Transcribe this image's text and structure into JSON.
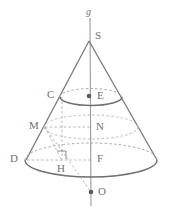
{
  "figure": {
    "stroke_color": "#7a7a7a",
    "dash_color": "#9a9a9a",
    "label_color": "#6f6f6f",
    "background": "#ffffff"
  },
  "labels": {
    "axis": "g",
    "apex": "S",
    "upper_left": "C",
    "upper_center": "E",
    "mid_left": "M",
    "mid_center": "N",
    "base_left": "D",
    "foot": "H",
    "base_center": "F",
    "below": "O"
  },
  "geometry": {
    "apex": [
      89,
      40
    ],
    "axis_top": [
      90,
      18
    ],
    "axis_bottom": [
      91,
      205
    ],
    "base_center": [
      91,
      160
    ],
    "base_rx": 66,
    "base_ry": 17,
    "upper_center": [
      91,
      96
    ],
    "upper_rx": 31,
    "upper_ry": 8,
    "mid_center": [
      91,
      128
    ],
    "mid_rx": 48,
    "mid_ry": 12,
    "point_C": [
      62,
      97
    ],
    "point_M": [
      45,
      126
    ],
    "point_D": [
      27,
      160
    ],
    "point_H": [
      62,
      161
    ],
    "point_O": [
      91,
      192
    ],
    "right_angle_at": "H"
  },
  "points_marked": [
    "E",
    "O"
  ]
}
